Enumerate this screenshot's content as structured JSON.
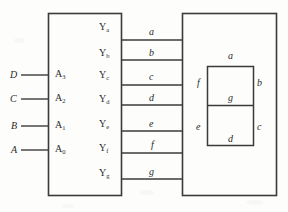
{
  "figure": {
    "type": "logic-diagram"
  },
  "decoder": {
    "name": "decoder-block",
    "inputs": [
      {
        "signal": "D",
        "port": "A",
        "port_sub": "3"
      },
      {
        "signal": "C",
        "port": "A",
        "port_sub": "2"
      },
      {
        "signal": "B",
        "port": "A",
        "port_sub": "1"
      },
      {
        "signal": "A",
        "port": "A",
        "port_sub": "0"
      }
    ],
    "outputs": [
      {
        "port": "Y",
        "port_sub": "a"
      },
      {
        "port": "Y",
        "port_sub": "b"
      },
      {
        "port": "Y",
        "port_sub": "c"
      },
      {
        "port": "Y",
        "port_sub": "d"
      },
      {
        "port": "Y",
        "port_sub": "e"
      },
      {
        "port": "Y",
        "port_sub": "f"
      },
      {
        "port": "Y",
        "port_sub": "g"
      }
    ]
  },
  "wires": {
    "name": "segment-bus",
    "labels": [
      "a",
      "b",
      "c",
      "d",
      "e",
      "f",
      "g"
    ]
  },
  "display": {
    "name": "seven-segment-display",
    "segments": [
      {
        "id": "a",
        "label": "a"
      },
      {
        "id": "b",
        "label": "b"
      },
      {
        "id": "c",
        "label": "c"
      },
      {
        "id": "d",
        "label": "d"
      },
      {
        "id": "e",
        "label": "e"
      },
      {
        "id": "f",
        "label": "f"
      },
      {
        "id": "g",
        "label": "g"
      }
    ]
  },
  "colors": {
    "line": "#3b3b3b",
    "text": "#2b2b2b",
    "background": "#fdfdfc"
  }
}
